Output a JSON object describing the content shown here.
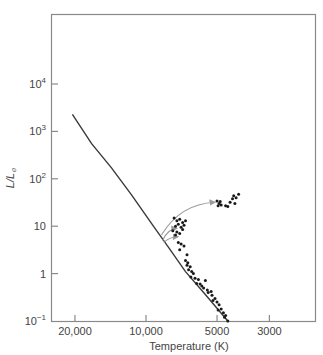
{
  "chart_data": {
    "type": "scatter",
    "title": "",
    "xlabel": "Temperature (K)",
    "ylabel": "L/L⊙",
    "x_scale": "log-reversed",
    "y_scale": "log",
    "x_ticks": [
      {
        "value": 20000,
        "label": "20,000"
      },
      {
        "value": 10000,
        "label": "10,000"
      },
      {
        "value": 5000,
        "label": "5000"
      },
      {
        "value": 3000,
        "label": "3000"
      }
    ],
    "y_ticks": [
      {
        "value": 0.1,
        "base": "10",
        "exp": "−1"
      },
      {
        "value": 1,
        "base": "1",
        "exp": ""
      },
      {
        "value": 10,
        "base": "10",
        "exp": ""
      },
      {
        "value": 100,
        "base": "10",
        "exp": "2"
      },
      {
        "value": 1000,
        "base": "10",
        "exp": "3"
      },
      {
        "value": 10000,
        "base": "10",
        "exp": "4"
      }
    ],
    "xlim": [
      30000,
      2000
    ],
    "ylim": [
      0.1,
      100000
    ],
    "grid": false,
    "legend": null,
    "series": [
      {
        "name": "main sequence (zero-age)",
        "kind": "line",
        "points": [
          [
            20500,
            2300
          ],
          [
            17000,
            550
          ],
          [
            14000,
            170
          ],
          [
            11500,
            45
          ],
          [
            9300,
            10
          ],
          [
            8000,
            3.5
          ],
          [
            6800,
            1.1
          ],
          [
            5700,
            0.4
          ],
          [
            4500,
            0.1
          ]
        ]
      },
      {
        "name": "evolutionary tracks (arrows)",
        "kind": "arrow",
        "tracks": [
          {
            "from": [
              8600,
              6.5
            ],
            "to": [
              5100,
              32
            ]
          },
          {
            "from": [
              8500,
              5
            ],
            "to": [
              7400,
              9
            ]
          },
          {
            "from": [
              8400,
              4.5
            ],
            "to": [
              7300,
              6
            ]
          }
        ]
      },
      {
        "name": "cluster stars (giants)",
        "kind": "scatter",
        "points": [
          [
            5000,
            34
          ],
          [
            4900,
            30
          ],
          [
            4950,
            27
          ],
          [
            4800,
            28
          ],
          [
            4600,
            27
          ],
          [
            4400,
            32
          ],
          [
            4300,
            38
          ],
          [
            4250,
            44
          ],
          [
            4150,
            40
          ],
          [
            4050,
            47
          ],
          [
            4200,
            30
          ],
          [
            4500,
            26
          ],
          [
            4850,
            33
          ]
        ]
      },
      {
        "name": "cluster stars (turnoff)",
        "kind": "scatter",
        "points": [
          [
            7600,
            15
          ],
          [
            7400,
            13
          ],
          [
            7200,
            14
          ],
          [
            7000,
            12
          ],
          [
            7300,
            11
          ],
          [
            7500,
            10
          ],
          [
            7100,
            9.5
          ],
          [
            6900,
            10.5
          ],
          [
            7700,
            8
          ],
          [
            7400,
            7.5
          ],
          [
            7200,
            7
          ],
          [
            7500,
            6.5
          ],
          [
            7000,
            8.5
          ],
          [
            6800,
            13
          ],
          [
            7300,
            4.5
          ],
          [
            7100,
            4.2
          ],
          [
            6900,
            3.8
          ],
          [
            7200,
            3.2
          ],
          [
            6700,
            2.5
          ]
        ]
      },
      {
        "name": "cluster stars (main sequence)",
        "kind": "scatter",
        "points": [
          [
            6800,
            1.9
          ],
          [
            6650,
            1.7
          ],
          [
            6700,
            1.5
          ],
          [
            6500,
            1.4
          ],
          [
            6600,
            1.2
          ],
          [
            6400,
            1.1
          ],
          [
            6300,
            1.0
          ],
          [
            6450,
            0.85
          ],
          [
            6200,
            0.8
          ],
          [
            6000,
            0.75
          ],
          [
            6100,
            0.62
          ],
          [
            5900,
            0.6
          ],
          [
            5800,
            0.55
          ],
          [
            5600,
            0.72
          ],
          [
            5700,
            0.5
          ],
          [
            5500,
            0.45
          ],
          [
            5450,
            0.4
          ],
          [
            5300,
            0.42
          ],
          [
            5250,
            0.35
          ],
          [
            5100,
            0.3
          ],
          [
            5200,
            0.27
          ],
          [
            5000,
            0.25
          ],
          [
            4900,
            0.22
          ],
          [
            4800,
            0.18
          ],
          [
            4950,
            0.17
          ],
          [
            4700,
            0.15
          ],
          [
            4600,
            0.13
          ],
          [
            4650,
            0.12
          ],
          [
            4500,
            0.1
          ]
        ]
      }
    ]
  }
}
